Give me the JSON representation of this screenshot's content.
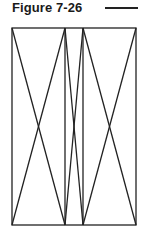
{
  "figure": {
    "title": "Figure 7-26",
    "line_color": "#222222",
    "frame": {
      "left": 12,
      "top": 28,
      "right": 136,
      "bottom": 225
    },
    "vertical_dividers_x": [
      65,
      83
    ],
    "panels": [
      {
        "name": "left",
        "x1": 12,
        "x2": 65
      },
      {
        "name": "middle",
        "x1": 65,
        "x2": 83
      },
      {
        "name": "right",
        "x1": 83,
        "x2": 136
      }
    ]
  }
}
